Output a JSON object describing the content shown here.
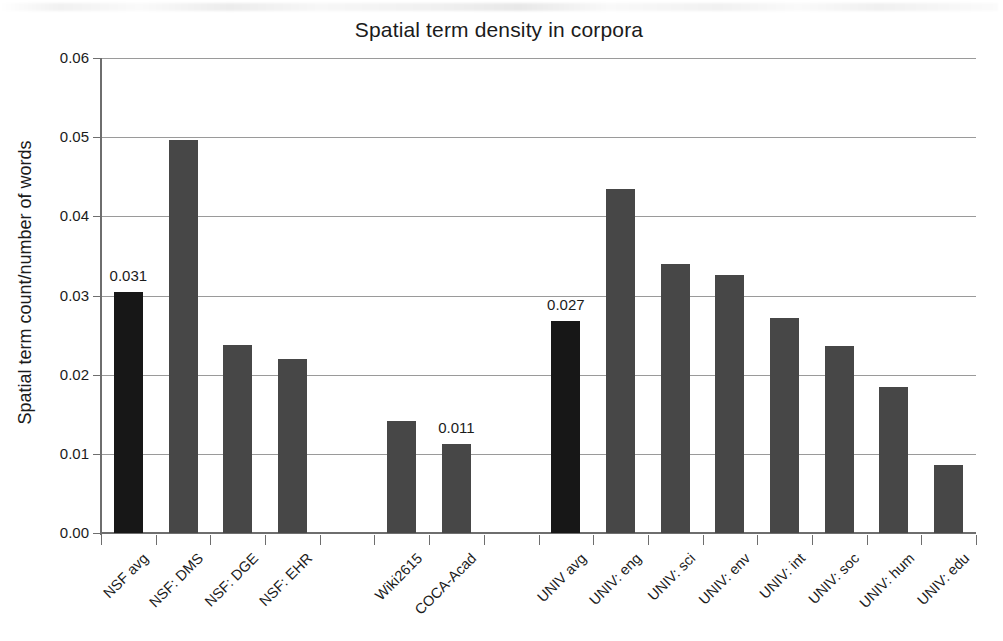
{
  "chart_data": {
    "type": "bar",
    "title": "Spatial term density in corpora",
    "xlabel": "",
    "ylabel": "Spatial term count/number of words",
    "ylim": [
      0.0,
      0.06
    ],
    "ytick_labels": [
      "0.00",
      "0.01",
      "0.02",
      "0.03",
      "0.04",
      "0.05",
      "0.06"
    ],
    "ytick_values": [
      0.0,
      0.01,
      0.02,
      0.03,
      0.04,
      0.05,
      0.06
    ],
    "grid": "horizontal",
    "legend": "none",
    "categories": [
      "NSF avg",
      "NSF: DMS",
      "NSF: DGE",
      "NSF: EHR",
      "Wiki2615",
      "COCA-Acad",
      "UNIV avg",
      "UNIV: eng",
      "UNIV: sci",
      "UNIV: env",
      "UNIV: int",
      "UNIV: soc",
      "UNIV: hum",
      "UNIV: edu"
    ],
    "values": [
      0.0305,
      0.0497,
      0.0237,
      0.022,
      0.0141,
      0.0113,
      0.0268,
      0.0435,
      0.034,
      0.0326,
      0.0272,
      0.0236,
      0.0184,
      0.0086
    ],
    "bars": [
      {
        "label": "NSF avg",
        "value": 0.0305,
        "slot": 0,
        "highlight": true,
        "data_label": "0.031"
      },
      {
        "label": "NSF: DMS",
        "value": 0.0497,
        "slot": 1,
        "highlight": false,
        "data_label": ""
      },
      {
        "label": "NSF: DGE",
        "value": 0.0237,
        "slot": 2,
        "highlight": false,
        "data_label": ""
      },
      {
        "label": "NSF: EHR",
        "value": 0.022,
        "slot": 3,
        "highlight": false,
        "data_label": ""
      },
      {
        "label": "Wiki2615",
        "value": 0.0141,
        "slot": 5,
        "highlight": false,
        "data_label": ""
      },
      {
        "label": "COCA-Acad",
        "value": 0.0113,
        "slot": 6,
        "highlight": false,
        "data_label": "0.011"
      },
      {
        "label": "UNIV avg",
        "value": 0.0268,
        "slot": 8,
        "highlight": true,
        "data_label": "0.027"
      },
      {
        "label": "UNIV: eng",
        "value": 0.0435,
        "slot": 9,
        "highlight": false,
        "data_label": ""
      },
      {
        "label": "UNIV: sci",
        "value": 0.034,
        "slot": 10,
        "highlight": false,
        "data_label": ""
      },
      {
        "label": "UNIV: env",
        "value": 0.0326,
        "slot": 11,
        "highlight": false,
        "data_label": ""
      },
      {
        "label": "UNIV: int",
        "value": 0.0272,
        "slot": 12,
        "highlight": false,
        "data_label": ""
      },
      {
        "label": "UNIV: soc",
        "value": 0.0236,
        "slot": 13,
        "highlight": false,
        "data_label": ""
      },
      {
        "label": "UNIV: hum",
        "value": 0.0184,
        "slot": 14,
        "highlight": false,
        "data_label": ""
      },
      {
        "label": "UNIV: edu",
        "value": 0.0086,
        "slot": 15,
        "highlight": false,
        "data_label": ""
      }
    ],
    "empty_slots": [
      4,
      7
    ],
    "total_slots": 16,
    "data_labels": [
      "0.031",
      "0.011",
      "0.027"
    ],
    "colors": {
      "bar": "#474747",
      "bar_highlight": "#171717",
      "gridline": "#9a9a9a",
      "axis": "#6e6e6e",
      "text": "#1b1b1b",
      "background": "#ffffff"
    }
  }
}
